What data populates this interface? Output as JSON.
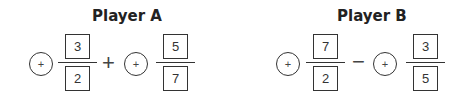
{
  "players": [
    {
      "title": "Player A",
      "sign1": "+",
      "frac1": {
        "num": "3",
        "den": "2"
      },
      "operator": "+",
      "sign2": "+",
      "frac2": {
        "num": "5",
        "den": "7"
      }
    },
    {
      "title": "Player B",
      "sign1": "+",
      "frac1": {
        "num": "7",
        "den": "2"
      },
      "operator": "−",
      "sign2": "+",
      "frac2": {
        "num": "3",
        "den": "5"
      }
    }
  ]
}
